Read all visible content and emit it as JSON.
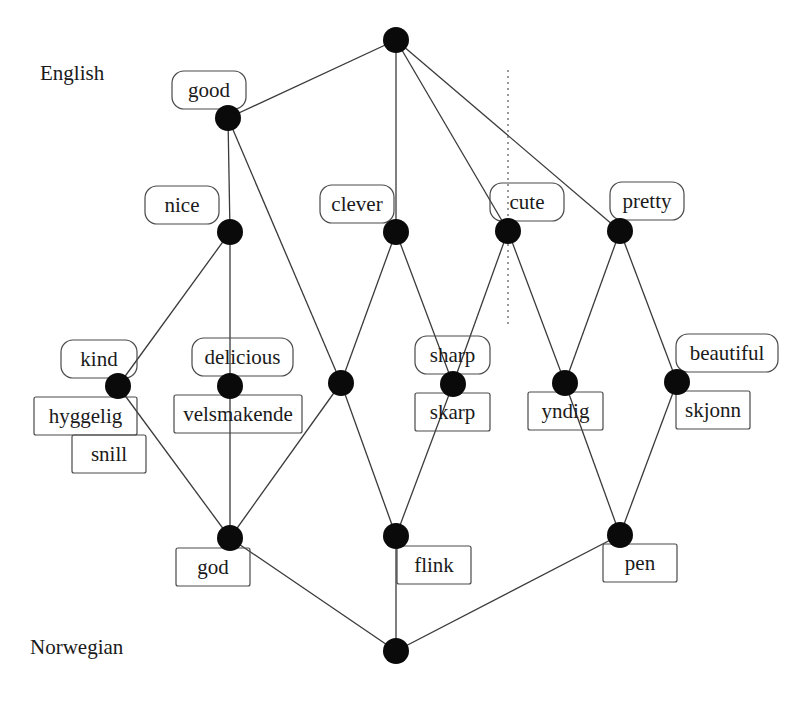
{
  "diagram": {
    "type": "lattice",
    "language_labels": [
      {
        "id": "english",
        "text": "English",
        "x": 40,
        "y": 80
      },
      {
        "id": "norwegian",
        "text": "Norwegian",
        "x": 30,
        "y": 654
      }
    ],
    "nodes": [
      {
        "id": "top",
        "x": 396,
        "y": 40
      },
      {
        "id": "good",
        "x": 228,
        "y": 118
      },
      {
        "id": "nice",
        "x": 230,
        "y": 232
      },
      {
        "id": "clever",
        "x": 396,
        "y": 232
      },
      {
        "id": "cute",
        "x": 508,
        "y": 231
      },
      {
        "id": "pretty",
        "x": 620,
        "y": 231
      },
      {
        "id": "kind",
        "x": 118,
        "y": 386
      },
      {
        "id": "delicious",
        "x": 230,
        "y": 386
      },
      {
        "id": "mid",
        "x": 341,
        "y": 383
      },
      {
        "id": "sharp",
        "x": 453,
        "y": 384
      },
      {
        "id": "yndig",
        "x": 565,
        "y": 383
      },
      {
        "id": "beautiful",
        "x": 677,
        "y": 382
      },
      {
        "id": "god",
        "x": 230,
        "y": 538
      },
      {
        "id": "flink",
        "x": 396,
        "y": 536
      },
      {
        "id": "pen",
        "x": 620,
        "y": 535
      },
      {
        "id": "bottom",
        "x": 396,
        "y": 651
      }
    ],
    "edges": [
      [
        "top",
        "good"
      ],
      [
        "top",
        "clever"
      ],
      [
        "top",
        "cute"
      ],
      [
        "top",
        "pretty"
      ],
      [
        "good",
        "nice"
      ],
      [
        "good",
        "mid"
      ],
      [
        "nice",
        "kind"
      ],
      [
        "nice",
        "delicious"
      ],
      [
        "clever",
        "mid"
      ],
      [
        "clever",
        "sharp"
      ],
      [
        "cute",
        "sharp"
      ],
      [
        "cute",
        "yndig"
      ],
      [
        "pretty",
        "yndig"
      ],
      [
        "pretty",
        "beautiful"
      ],
      [
        "kind",
        "god"
      ],
      [
        "delicious",
        "god"
      ],
      [
        "mid",
        "god"
      ],
      [
        "mid",
        "flink"
      ],
      [
        "sharp",
        "flink"
      ],
      [
        "yndig",
        "pen"
      ],
      [
        "beautiful",
        "pen"
      ],
      [
        "god",
        "bottom"
      ],
      [
        "flink",
        "bottom"
      ],
      [
        "pen",
        "bottom"
      ]
    ],
    "english_labels": [
      {
        "node": "good",
        "text": "good",
        "x": 172,
        "y": 71,
        "w": 74,
        "h": 38
      },
      {
        "node": "nice",
        "text": "nice",
        "x": 145,
        "y": 186,
        "w": 74,
        "h": 38
      },
      {
        "node": "clever",
        "text": "clever",
        "x": 320,
        "y": 185,
        "w": 74,
        "h": 38
      },
      {
        "node": "cute",
        "text": "cute",
        "x": 490,
        "y": 183,
        "w": 74,
        "h": 38
      },
      {
        "node": "pretty",
        "text": "pretty",
        "x": 610,
        "y": 182,
        "w": 74,
        "h": 38
      },
      {
        "node": "kind",
        "text": "kind",
        "x": 61,
        "y": 340,
        "w": 76,
        "h": 38
      },
      {
        "node": "delicious",
        "text": "delicious",
        "x": 192,
        "y": 338,
        "w": 101,
        "h": 38
      },
      {
        "node": "sharp",
        "text": "sharp",
        "x": 415,
        "y": 336,
        "w": 75,
        "h": 38
      },
      {
        "node": "beautiful",
        "text": "beautiful",
        "x": 676,
        "y": 334,
        "w": 102,
        "h": 38
      }
    ],
    "norwegian_labels": [
      {
        "node": "kind",
        "text": "hyggelig",
        "x": 34,
        "y": 397,
        "w": 103,
        "h": 38
      },
      {
        "node": "kind",
        "text": "snill",
        "x": 72,
        "y": 435,
        "w": 74,
        "h": 38
      },
      {
        "node": "delicious",
        "text": "velsmakende",
        "x": 174,
        "y": 395,
        "w": 128,
        "h": 38
      },
      {
        "node": "sharp",
        "text": "skarp",
        "x": 415,
        "y": 393,
        "w": 75,
        "h": 38
      },
      {
        "node": "yndig",
        "text": "yndig",
        "x": 528,
        "y": 392,
        "w": 75,
        "h": 38
      },
      {
        "node": "beautiful",
        "text": "skjonn",
        "x": 676,
        "y": 391,
        "w": 74,
        "h": 38
      },
      {
        "node": "god",
        "text": "god",
        "x": 176,
        "y": 548,
        "w": 74,
        "h": 38
      },
      {
        "node": "flink",
        "text": "flink",
        "x": 397,
        "y": 546,
        "w": 74,
        "h": 38
      },
      {
        "node": "pen",
        "text": "pen",
        "x": 603,
        "y": 544,
        "w": 74,
        "h": 38
      }
    ],
    "dotted_divider": {
      "x": 508,
      "y1": 70,
      "y2": 325
    },
    "style": {
      "node_color": "#0a0a0a",
      "edge_color": "#3a3a3a",
      "box_stroke": "#4a4a4a",
      "node_radius": 13
    }
  }
}
